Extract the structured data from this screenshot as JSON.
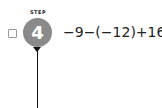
{
  "step": {
    "label": "STEP",
    "number": "4",
    "circle_color": "#8a8a8a"
  },
  "expression": "−9−(−12)+16",
  "checkbox": {
    "checked": false
  }
}
